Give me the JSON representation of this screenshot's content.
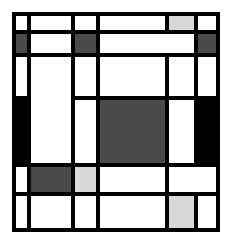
{
  "artwork": {
    "title": "Mondrian-style Neoplastic Composition",
    "style": "de-stijl-grid",
    "canvas": {
      "width": 232,
      "height": 243,
      "background": "#ffffff"
    },
    "frame": {
      "left": 12,
      "top": 12,
      "width": 208,
      "height": 220,
      "line_color": "#000000"
    },
    "palette": {
      "line": "#000000",
      "white": "#ffffff",
      "light_gray": "#d8d8d8",
      "dark_gray": "#4a4a4a",
      "black": "#000000"
    },
    "grid": {
      "column_edges": [
        0,
        19,
        63,
        88,
        157,
        186,
        208
      ],
      "row_edges": [
        0,
        22,
        45,
        88,
        155,
        184,
        220
      ],
      "line_thickness": 4,
      "columns": 6,
      "rows": 6
    },
    "cells": [
      {
        "name": "r1c1",
        "color": "white",
        "x": 4,
        "y": 4,
        "w": 11,
        "h": 14
      },
      {
        "name": "r1c2",
        "color": "white",
        "x": 19,
        "y": 4,
        "w": 40,
        "h": 14
      },
      {
        "name": "r1c3",
        "color": "white",
        "x": 63,
        "y": 4,
        "w": 21,
        "h": 14
      },
      {
        "name": "r1c4",
        "color": "white",
        "x": 88,
        "y": 4,
        "w": 65,
        "h": 14
      },
      {
        "name": "r1c5",
        "color": "light_gray",
        "x": 157,
        "y": 4,
        "w": 25,
        "h": 14
      },
      {
        "name": "r1c6",
        "color": "white",
        "x": 186,
        "y": 4,
        "w": 18,
        "h": 14
      },
      {
        "name": "r2c1",
        "color": "dark_gray",
        "x": 4,
        "y": 22,
        "w": 11,
        "h": 19
      },
      {
        "name": "r2c2",
        "color": "white",
        "x": 19,
        "y": 22,
        "w": 40,
        "h": 19
      },
      {
        "name": "r2c3",
        "color": "dark_gray",
        "x": 63,
        "y": 22,
        "w": 21,
        "h": 19
      },
      {
        "name": "r2c4",
        "color": "white",
        "x": 88,
        "y": 22,
        "w": 94,
        "h": 19
      },
      {
        "name": "r2c6",
        "color": "dark_gray",
        "x": 186,
        "y": 22,
        "w": 18,
        "h": 19
      },
      {
        "name": "r3c1",
        "color": "white",
        "x": 4,
        "y": 45,
        "w": 11,
        "h": 39
      },
      {
        "name": "r3c2",
        "color": "white",
        "x": 19,
        "y": 45,
        "w": 40,
        "h": 106
      },
      {
        "name": "r3c3",
        "color": "white",
        "x": 63,
        "y": 45,
        "w": 21,
        "h": 39
      },
      {
        "name": "r3c4",
        "color": "white",
        "x": 88,
        "y": 45,
        "w": 65,
        "h": 39
      },
      {
        "name": "r3c5",
        "color": "white",
        "x": 157,
        "y": 45,
        "w": 25,
        "h": 39
      },
      {
        "name": "r3c6",
        "color": "white",
        "x": 186,
        "y": 45,
        "w": 18,
        "h": 39
      },
      {
        "name": "r4c1",
        "color": "black",
        "x": 4,
        "y": 88,
        "w": 11,
        "h": 63
      },
      {
        "name": "r4c3",
        "color": "white",
        "x": 63,
        "y": 88,
        "w": 21,
        "h": 63
      },
      {
        "name": "r4c4",
        "color": "dark_gray",
        "x": 88,
        "y": 88,
        "w": 65,
        "h": 63
      },
      {
        "name": "r4c5",
        "color": "white",
        "x": 157,
        "y": 88,
        "w": 25,
        "h": 63
      },
      {
        "name": "r4c6",
        "color": "black",
        "x": 186,
        "y": 88,
        "w": 18,
        "h": 63
      },
      {
        "name": "r5c1",
        "color": "white",
        "x": 4,
        "y": 155,
        "w": 11,
        "h": 25
      },
      {
        "name": "r5c2",
        "color": "dark_gray",
        "x": 19,
        "y": 155,
        "w": 40,
        "h": 25
      },
      {
        "name": "r5c3",
        "color": "light_gray",
        "x": 63,
        "y": 155,
        "w": 21,
        "h": 25
      },
      {
        "name": "r5c4",
        "color": "white",
        "x": 88,
        "y": 155,
        "w": 65,
        "h": 25
      },
      {
        "name": "r5c5",
        "color": "white",
        "x": 157,
        "y": 155,
        "w": 47,
        "h": 25
      },
      {
        "name": "r6c1",
        "color": "white",
        "x": 4,
        "y": 184,
        "w": 11,
        "h": 32
      },
      {
        "name": "r6c2",
        "color": "white",
        "x": 19,
        "y": 184,
        "w": 40,
        "h": 32
      },
      {
        "name": "r6c3",
        "color": "white",
        "x": 63,
        "y": 184,
        "w": 21,
        "h": 32
      },
      {
        "name": "r6c4",
        "color": "white",
        "x": 88,
        "y": 184,
        "w": 65,
        "h": 32
      },
      {
        "name": "r6c5",
        "color": "light_gray",
        "x": 157,
        "y": 184,
        "w": 25,
        "h": 32
      },
      {
        "name": "r6c6",
        "color": "white",
        "x": 186,
        "y": 184,
        "w": 18,
        "h": 32
      }
    ]
  }
}
